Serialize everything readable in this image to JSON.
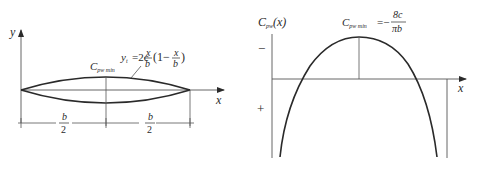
{
  "left_panel": {
    "y_axis_label": "y",
    "x_axis_label": "x",
    "point_label_main": "C",
    "point_label_sub": "pw min",
    "equation": {
      "lhs": "y",
      "lhs_sub": "t",
      "eq_prefix": "=2c",
      "frac1_num": "x",
      "frac1_den": "b",
      "paren_open": "(1−",
      "frac2_num": "x",
      "frac2_den": "b",
      "paren_close": ")"
    },
    "dimensions": [
      {
        "num": "b",
        "den": "2"
      },
      {
        "num": "b",
        "den": "2"
      }
    ]
  },
  "right_panel": {
    "y_axis_label_main": "C",
    "y_axis_label_sub": "pw",
    "y_axis_label_arg": "(x)",
    "x_axis_label": "x",
    "minus_sign": "−",
    "plus_sign": "+",
    "peak_label_main": "C",
    "peak_label_sub": "pw min",
    "peak_eq": "=−",
    "peak_frac_num": "8c",
    "peak_frac_den": "πb"
  },
  "colors": {
    "line": "#2a2a2a",
    "thin": "#555555",
    "background": "#ffffff"
  }
}
